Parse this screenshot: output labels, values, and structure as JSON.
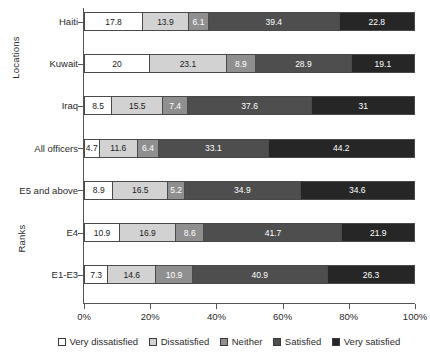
{
  "chart_data": {
    "type": "bar",
    "orientation": "horizontal",
    "stacked": true,
    "stack_total": 100,
    "title": "",
    "subtitle": "",
    "xlabel": "",
    "ylabel": "",
    "xlim": [
      0,
      100
    ],
    "x_tick_labels": [
      "0%",
      "20%",
      "40%",
      "60%",
      "80%",
      "100%"
    ],
    "x_tick_values": [
      0,
      20,
      40,
      60,
      80,
      100
    ],
    "grid": false,
    "legend_position": "bottom",
    "categories": [
      "Haiti",
      "Kuwait",
      "Iraq",
      "All officers",
      "E5 and above",
      "E4",
      "E1-E3"
    ],
    "category_groups": [
      {
        "label": "Locations",
        "categories": [
          "Haiti",
          "Kuwait",
          "Iraq"
        ]
      },
      {
        "label": "Ranks",
        "categories": [
          "All officers",
          "E5 and above",
          "E4",
          "E1-E3"
        ]
      }
    ],
    "series": [
      {
        "name": "Very dissatisfied",
        "color": "#ffffff",
        "values": [
          17.8,
          20,
          8.5,
          4.7,
          8.9,
          10.9,
          7.3
        ]
      },
      {
        "name": "Dissatisfied",
        "color": "#d2d2d2",
        "values": [
          13.9,
          23.1,
          15.5,
          11.6,
          16.5,
          16.9,
          14.6
        ]
      },
      {
        "name": "Neither",
        "color": "#8f8f8f",
        "values": [
          6.1,
          8.9,
          7.4,
          6.4,
          5.2,
          8.6,
          10.9
        ]
      },
      {
        "name": "Satisfied",
        "color": "#4e4e4e",
        "values": [
          39.4,
          28.9,
          37.6,
          33.1,
          34.9,
          41.7,
          40.9
        ]
      },
      {
        "name": "Very satisfied",
        "color": "#262626",
        "values": [
          22.8,
          19.1,
          31,
          44.2,
          34.6,
          21.9,
          26.3
        ]
      }
    ],
    "bars": [
      {
        "category": "Haiti",
        "group": "Locations",
        "segments": [
          {
            "label": "17.8",
            "value": 17.8
          },
          {
            "label": "13.9",
            "value": 13.9
          },
          {
            "label": "6.1",
            "value": 6.1
          },
          {
            "label": "39.4",
            "value": 39.4
          },
          {
            "label": "22.8",
            "value": 22.8
          }
        ]
      },
      {
        "category": "Kuwait",
        "group": "Locations",
        "segments": [
          {
            "label": "20",
            "value": 20
          },
          {
            "label": "23.1",
            "value": 23.1
          },
          {
            "label": "8.9",
            "value": 8.9
          },
          {
            "label": "28.9",
            "value": 28.9
          },
          {
            "label": "19.1",
            "value": 19.1
          }
        ]
      },
      {
        "category": "Iraq",
        "group": "Locations",
        "segments": [
          {
            "label": "8.5",
            "value": 8.5
          },
          {
            "label": "15.5",
            "value": 15.5
          },
          {
            "label": "7.4",
            "value": 7.4
          },
          {
            "label": "37.6",
            "value": 37.6
          },
          {
            "label": "31",
            "value": 31
          }
        ]
      },
      {
        "category": "All officers",
        "group": "Ranks",
        "segments": [
          {
            "label": "4.7",
            "value": 4.7
          },
          {
            "label": "11.6",
            "value": 11.6
          },
          {
            "label": "6.4",
            "value": 6.4
          },
          {
            "label": "33.1",
            "value": 33.1
          },
          {
            "label": "44.2",
            "value": 44.2
          }
        ]
      },
      {
        "category": "E5 and above",
        "group": "Ranks",
        "segments": [
          {
            "label": "8.9",
            "value": 8.9
          },
          {
            "label": "16.5",
            "value": 16.5
          },
          {
            "label": "5.2",
            "value": 5.2
          },
          {
            "label": "34.9",
            "value": 34.9
          },
          {
            "label": "34.6",
            "value": 34.6
          }
        ]
      },
      {
        "category": "E4",
        "group": "Ranks",
        "segments": [
          {
            "label": "10.9",
            "value": 10.9
          },
          {
            "label": "16.9",
            "value": 16.9
          },
          {
            "label": "8.6",
            "value": 8.6
          },
          {
            "label": "41.7",
            "value": 41.7
          },
          {
            "label": "21.9",
            "value": 21.9
          }
        ]
      },
      {
        "category": "E1-E3",
        "group": "Ranks",
        "segments": [
          {
            "label": "7.3",
            "value": 7.3
          },
          {
            "label": "14.6",
            "value": 14.6
          },
          {
            "label": "10.9",
            "value": 10.9
          },
          {
            "label": "40.9",
            "value": 40.9
          },
          {
            "label": "26.3",
            "value": 26.3
          }
        ]
      }
    ],
    "legend": [
      {
        "label": "Very dissatisfied",
        "color": "#ffffff"
      },
      {
        "label": "Dissatisfied",
        "color": "#d2d2d2"
      },
      {
        "label": "Neither",
        "color": "#8f8f8f"
      },
      {
        "label": "Satisfied",
        "color": "#4e4e4e"
      },
      {
        "label": "Very satisfied",
        "color": "#262626"
      }
    ]
  }
}
